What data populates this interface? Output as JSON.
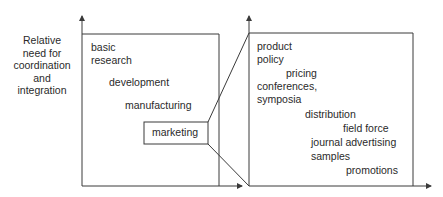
{
  "y_axis_label": [
    "Relative",
    "need for",
    "coordination",
    "and",
    "integration"
  ],
  "left_panel": {
    "items": [
      {
        "label": "basic",
        "x": 91,
        "y": 40
      },
      {
        "label": "research",
        "x": 91,
        "y": 53
      },
      {
        "label": "development",
        "x": 109,
        "y": 75
      },
      {
        "label": "manufacturing",
        "x": 125,
        "y": 98
      }
    ],
    "highlight": {
      "label": "marketing"
    }
  },
  "right_panel": {
    "items": [
      {
        "label": "product",
        "x": 257,
        "y": 40
      },
      {
        "label": "policy",
        "x": 257,
        "y": 53
      },
      {
        "label": "pricing",
        "x": 286,
        "y": 67
      },
      {
        "label": "conferences,",
        "x": 257,
        "y": 80
      },
      {
        "label": "symposia",
        "x": 257,
        "y": 93
      },
      {
        "label": "distribution",
        "x": 305,
        "y": 108
      },
      {
        "label": "field force",
        "x": 343,
        "y": 122
      },
      {
        "label": "journal advertising",
        "x": 311,
        "y": 136
      },
      {
        "label": "samples",
        "x": 311,
        "y": 150
      },
      {
        "label": "promotions",
        "x": 346,
        "y": 164
      }
    ]
  },
  "colors": {
    "line": "#3a3a3a",
    "text": "#2a2a2a"
  }
}
